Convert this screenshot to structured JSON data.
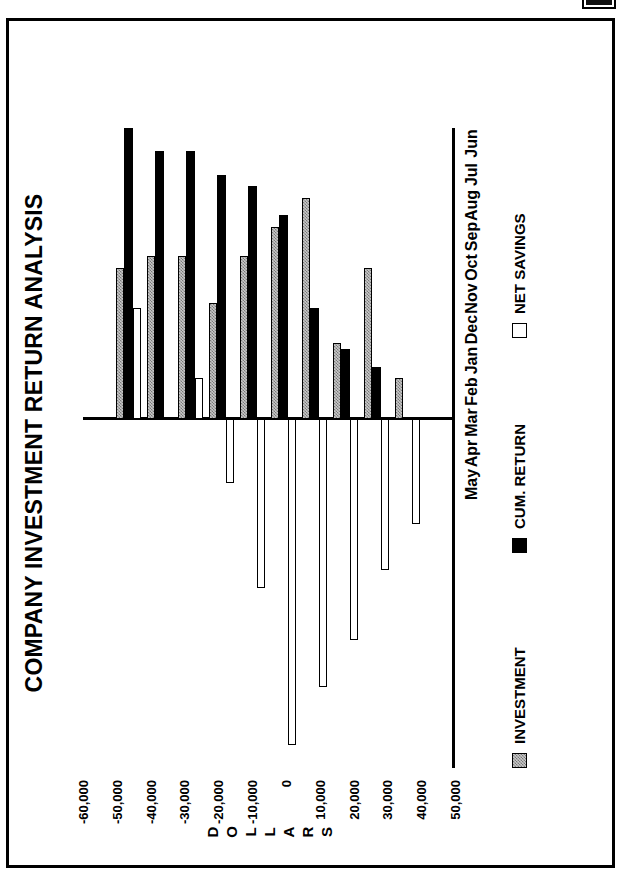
{
  "document": {
    "page_background": "#ffffff",
    "border_color": "#000000"
  },
  "corner_marker": {
    "name": "black-square-mark",
    "color": "#000000"
  },
  "chart_data": {
    "type": "bar",
    "orientation": "horizontal-rotated",
    "title": "COMPANY INVESTMENT RETURN ANALYSIS",
    "xlabel": "",
    "ylabel": "DOLLARS",
    "ylabel_letters": [
      "D",
      "O",
      "L",
      "L",
      "A",
      "R",
      "S"
    ],
    "categories": [
      "Jun",
      "Jul",
      "Aug",
      "Sep",
      "Oct",
      "Nov",
      "Dec",
      "Jan",
      "Feb",
      "Mar",
      "Apr",
      "May"
    ],
    "ylim": [
      -60000,
      50000
    ],
    "yticks": [
      50000,
      40000,
      30000,
      20000,
      10000,
      0,
      -10000,
      -20000,
      -30000,
      -40000,
      -50000,
      -60000
    ],
    "ytick_labels": [
      "50,000",
      "40,000",
      "30,000",
      "20,000",
      "10,000",
      "0",
      "-10,000",
      "-20,000",
      "-30,000",
      "-40,000",
      "-50,000",
      "-60,000"
    ],
    "grid": false,
    "legend_position": "bottom",
    "series": [
      {
        "name": "INVESTMENT",
        "color": "#c8c8c8",
        "pattern": "cross-hatch",
        "values": [
          0,
          7000,
          26000,
          13000,
          38000,
          33000,
          28000,
          20000,
          28000,
          28000,
          26000,
          0
        ]
      },
      {
        "name": "CUM. RETURN",
        "color": "#000000",
        "pattern": "solid",
        "values": [
          0,
          0,
          9000,
          12000,
          19000,
          35000,
          40000,
          42000,
          46000,
          46000,
          50000,
          0
        ]
      },
      {
        "name": "NET SAVINGS",
        "color": "#ffffff",
        "pattern": "outline",
        "values": [
          0,
          -18000,
          -26000,
          -38000,
          -46000,
          -56000,
          -29000,
          -11000,
          7000,
          0,
          19000,
          0
        ]
      }
    ]
  },
  "legend": {
    "entries": [
      {
        "label": "INVESTMENT",
        "swatch": "investment-swatch"
      },
      {
        "label": "CUM. RETURN",
        "swatch": "cum-return-swatch"
      },
      {
        "label": "NET SAVINGS",
        "swatch": "net-savings-swatch"
      }
    ]
  }
}
